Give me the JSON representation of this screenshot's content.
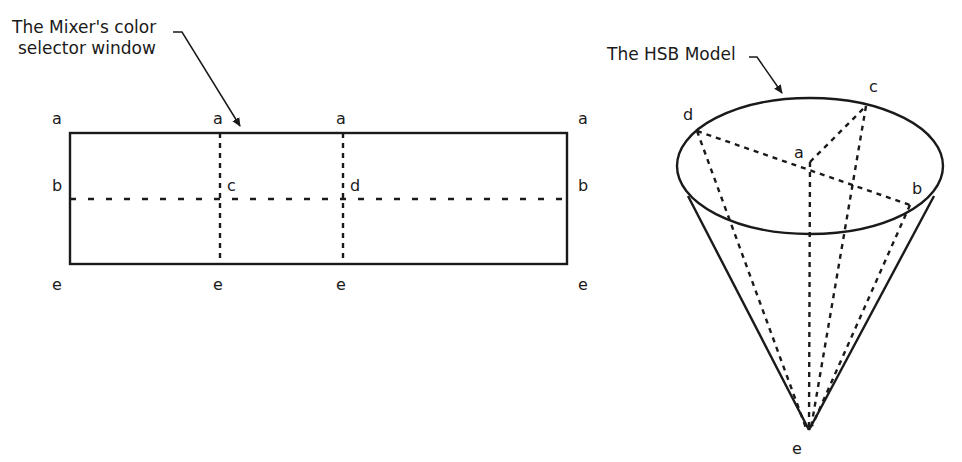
{
  "left_diagram": {
    "caption_line1": "The Mixer's color",
    "caption_line2": "selector window",
    "corner_labels": {
      "top": [
        "a",
        "a",
        "a",
        "a"
      ],
      "middle_left": "b",
      "middle_c": "c",
      "middle_d": "d",
      "middle_right": "b",
      "bottom": [
        "e",
        "e",
        "e",
        "e"
      ]
    }
  },
  "right_diagram": {
    "caption": "The HSB Model",
    "point_labels": {
      "a": "a",
      "b": "b",
      "c": "c",
      "d": "d",
      "e": "e"
    }
  },
  "colors": {
    "ink": "#1a1a1a",
    "background": "#ffffff"
  }
}
